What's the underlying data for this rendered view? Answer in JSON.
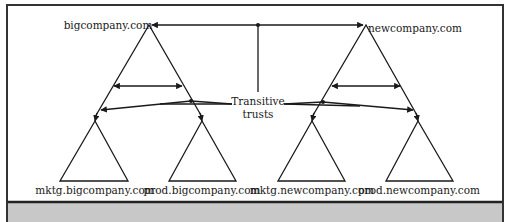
{
  "diagram": {
    "trees": [
      {
        "root": "bigcompany.com",
        "children": [
          "mktg.bigcompany.com",
          "prod.bigcompany.com"
        ]
      },
      {
        "root": "newcompany.com",
        "children": [
          "mktg.newcompany.com",
          "prod.newcompany.com"
        ]
      }
    ],
    "callout_label_line1": "Transitive",
    "callout_label_line2": "trusts",
    "colors": {
      "line": "#1a1a1a",
      "background": "#ffffff",
      "frame": "#333333",
      "footer_band": "#c8c8c8"
    }
  },
  "labels": {
    "root_left": "bigcompany.com",
    "root_right": "newcompany.com",
    "child_1": "mktg.bigcompany.com",
    "child_2": "prod.bigcompany.com",
    "child_3": "mktg.newcompany.com",
    "child_4": "prod.newcompany.com"
  }
}
